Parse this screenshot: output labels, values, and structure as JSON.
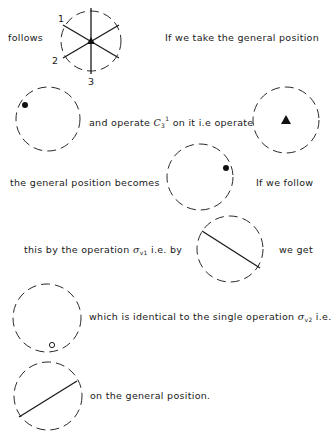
{
  "text": {
    "follows": "follows",
    "take_general": "If we take the general position",
    "and_operate_pre": "and  operate ",
    "c3_symbol": "C",
    "c3_sub": "3",
    "c3_sup": "1",
    "and_operate_post": " on it  i.e operate",
    "becomes": "the  general  position  becomes",
    "if_follow": "If  we  follow",
    "this_by_pre": "this  by  the  operation  ",
    "sigma": "σ",
    "sigma_v1_sub": "v1",
    "this_by_post": "  i.e.  by",
    "we_get": "we  get",
    "which_is_pre": "which is   identical to the single operation  ",
    "sigma_v2_sub": "v2",
    "which_is_post": "   i.e.",
    "on_general": "on  the  general  position."
  },
  "figure_labels": {
    "axis_1": "1",
    "axis_2": "2",
    "axis_3": "3"
  },
  "diagrams": [
    {
      "name": "c3v-elements",
      "cx": 91,
      "cy": 41,
      "r": 30
    },
    {
      "name": "general-position-start",
      "cx": 48,
      "cy": 119,
      "r": 32,
      "marker": "filled-dot",
      "mx": 25,
      "my": 105
    },
    {
      "name": "c3-operation",
      "cx": 286,
      "cy": 120,
      "r": 33,
      "marker": "triangle"
    },
    {
      "name": "general-position-after-c3",
      "cx": 200,
      "cy": 177,
      "r": 33,
      "marker": "filled-dot",
      "mx": 226,
      "my": 168
    },
    {
      "name": "sigma-v1-operation",
      "cx": 230,
      "cy": 249,
      "r": 33,
      "marker": "mirror-line"
    },
    {
      "name": "result-position",
      "cx": 47,
      "cy": 318,
      "r": 34,
      "marker": "open-dot",
      "mx": 52,
      "my": 345
    },
    {
      "name": "sigma-v2-operation",
      "cx": 48,
      "cy": 396,
      "r": 34,
      "marker": "mirror-line"
    }
  ],
  "colors": {
    "ink": "#1a1a1a",
    "background": "#ffffff"
  }
}
